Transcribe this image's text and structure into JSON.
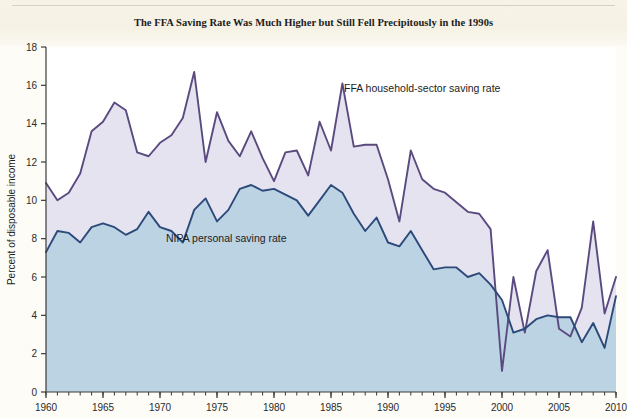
{
  "figure": {
    "title": "The FFA Saving Rate Was Much Higher but Still Fell Precipitously in the 1990s"
  },
  "colors": {
    "ffa_line": "#5b4a80",
    "nipa_line": "#2b4a7a",
    "ffa_fill": "#e4e3ef",
    "nipa_fill": "#bcd3e3",
    "axis": "#3a3a3a",
    "page_background": "#fdfcf7",
    "plot_background": "#ffffff",
    "text": "#1c1c1c"
  },
  "labels": {
    "ffa_series_label": "FFA household-sector saving rate",
    "nipa_series_label": "NIPA personal saving rate",
    "y_axis_title": "Percent of disposable income"
  },
  "chart_data": {
    "type": "area",
    "title": "The FFA Saving Rate Was Much Higher but Still Fell Precipitously in the 1990s",
    "xlabel": "",
    "ylabel": "Percent of disposable income",
    "xlim": [
      1960,
      2010
    ],
    "ylim": [
      0,
      18
    ],
    "ytick_step": 2,
    "yticks": [
      0,
      2,
      4,
      6,
      8,
      10,
      12,
      14,
      16,
      18
    ],
    "xticks_major": [
      1960,
      1965,
      1970,
      1975,
      1980,
      1985,
      1990,
      1995,
      2000,
      2005,
      2010
    ],
    "xtick_minor_step": 1,
    "grid": false,
    "legend": "inline-annotations",
    "x": [
      1960,
      1961,
      1962,
      1963,
      1964,
      1965,
      1966,
      1967,
      1968,
      1969,
      1970,
      1971,
      1972,
      1973,
      1974,
      1975,
      1976,
      1977,
      1978,
      1979,
      1980,
      1981,
      1982,
      1983,
      1984,
      1985,
      1986,
      1987,
      1988,
      1989,
      1990,
      1991,
      1992,
      1993,
      1994,
      1995,
      1996,
      1997,
      1998,
      1999,
      2000,
      2001,
      2002,
      2003,
      2004,
      2005,
      2006,
      2007,
      2008,
      2009,
      2010
    ],
    "series": [
      {
        "name": "FFA household-sector saving rate",
        "color": "#5b4a80",
        "fill": "#e4e3ef",
        "values": [
          10.9,
          10.0,
          10.4,
          11.4,
          13.6,
          14.1,
          15.1,
          14.7,
          12.5,
          12.3,
          13.0,
          13.4,
          14.3,
          16.7,
          12.0,
          14.6,
          13.1,
          12.3,
          13.6,
          12.2,
          11.0,
          12.5,
          12.6,
          11.3,
          14.1,
          12.6,
          16.1,
          12.8,
          12.9,
          12.9,
          11.1,
          8.9,
          12.6,
          11.1,
          10.6,
          10.4,
          9.9,
          9.4,
          9.3,
          8.5,
          1.1,
          6.0,
          3.1,
          6.3,
          7.4,
          3.3,
          2.9,
          4.4,
          8.9,
          4.1,
          6.0
        ]
      },
      {
        "name": "NIPA personal saving rate",
        "color": "#2b4a7a",
        "fill": "#bcd3e3",
        "values": [
          7.3,
          8.4,
          8.3,
          7.8,
          8.6,
          8.8,
          8.6,
          8.2,
          8.5,
          9.4,
          8.6,
          8.4,
          7.8,
          9.5,
          10.1,
          8.9,
          9.5,
          10.6,
          10.8,
          10.5,
          10.6,
          10.3,
          10.0,
          9.2,
          10.0,
          10.8,
          10.4,
          9.3,
          8.4,
          9.1,
          7.8,
          7.6,
          8.4,
          7.4,
          6.4,
          6.5,
          6.5,
          6.0,
          6.2,
          5.6,
          4.8,
          3.1,
          3.3,
          3.8,
          4.0,
          3.9,
          3.9,
          2.6,
          3.6,
          2.3,
          5.0
        ]
      }
    ]
  }
}
